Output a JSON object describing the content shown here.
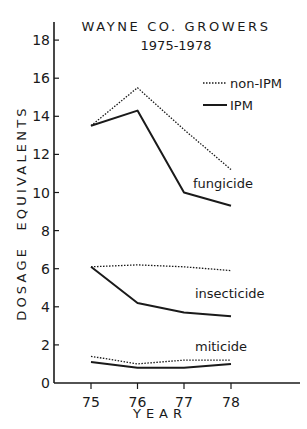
{
  "chart_data": {
    "type": "line",
    "title": "WAYNE CO. GROWERS",
    "subtitle": "1975-1978",
    "xlabel": "YEAR",
    "ylabel": "DOSAGE EQUIVALENTS",
    "x": [
      "75",
      "76",
      "77",
      "78"
    ],
    "yticks": [
      "0",
      "2",
      "4",
      "6",
      "8",
      "10",
      "12",
      "14",
      "16",
      "18"
    ],
    "ylim": [
      0,
      18.5
    ],
    "grid": false,
    "legend": {
      "position": "upper right",
      "entries": [
        {
          "label": "non-IPM",
          "style": "dotted"
        },
        {
          "label": "IPM",
          "style": "solid"
        }
      ]
    },
    "series": [
      {
        "name": "fungicide non-IPM",
        "group": "fungicide",
        "style": "dotted",
        "values": [
          13.5,
          15.5,
          13.3,
          11.2
        ]
      },
      {
        "name": "fungicide IPM",
        "group": "fungicide",
        "style": "solid",
        "values": [
          13.5,
          14.3,
          10.0,
          9.3
        ]
      },
      {
        "name": "insecticide non-IPM",
        "group": "insecticide",
        "style": "dotted",
        "values": [
          6.1,
          6.2,
          6.1,
          5.9
        ]
      },
      {
        "name": "insecticide IPM",
        "group": "insecticide",
        "style": "solid",
        "values": [
          6.1,
          4.2,
          3.7,
          3.5
        ]
      },
      {
        "name": "miticide non-IPM",
        "group": "miticide",
        "style": "dotted",
        "values": [
          1.4,
          1.0,
          1.2,
          1.2
        ]
      },
      {
        "name": "miticide IPM",
        "group": "miticide",
        "style": "solid",
        "values": [
          1.1,
          0.8,
          0.8,
          1.0
        ]
      }
    ],
    "annotations": [
      "fungicide",
      "insecticide",
      "miticide"
    ]
  },
  "colors": {
    "ink": "#1a1a1a",
    "background": "#ffffff"
  }
}
